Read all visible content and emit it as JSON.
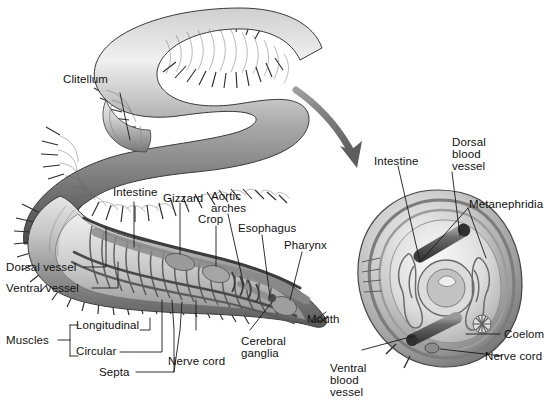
{
  "figure": {
    "type": "biological-illustration",
    "background_color": "#ffffff",
    "line_color": "#1a1a1a",
    "arrow_color": "#6e6e6e",
    "panels": [
      {
        "name": "whole-body-and-longitudinal-section",
        "side": "left"
      },
      {
        "name": "cross-section",
        "side": "right"
      }
    ]
  },
  "labels": {
    "clitellum": "Clitellum",
    "intestine_left": "Intestine",
    "gizzard": "Gizzard",
    "aortic_arches_line1": "Aortic",
    "aortic_arches_line2": "arches",
    "crop": "Crop",
    "esophagus": "Esophagus",
    "pharynx": "Pharynx",
    "mouth": "Mouth",
    "dorsal_vessel": "Dorsal vessel",
    "ventral_vessel": "Ventral vessel",
    "muscles": "Muscles",
    "longitudinal": "Longitudinal",
    "circular": "Circular",
    "septa": "Septa",
    "nerve_cord_left": "Nerve cord",
    "cerebral_ganglia_line1": "Cerebral",
    "cerebral_ganglia_line2": "ganglia",
    "intestine_right": "Intestine",
    "dorsal_blood_vessel_line1": "Dorsal",
    "dorsal_blood_vessel_line2": "blood",
    "dorsal_blood_vessel_line3": "vessel",
    "metanephridia": "Metanephridia",
    "coelom": "Coelom",
    "nerve_cord_right": "Nerve cord",
    "ventral_blood_vessel_line1": "Ventral",
    "ventral_blood_vessel_line2": "blood",
    "ventral_blood_vessel_line3": "vessel"
  }
}
